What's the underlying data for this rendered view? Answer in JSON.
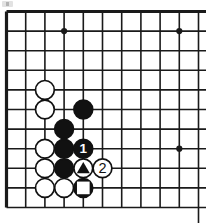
{
  "diagram": {
    "type": "go-board-corner-diagram",
    "board": {
      "cols": 11,
      "rows": 11,
      "x_start": 6.5,
      "y_start": 11.5,
      "spacing_x": 19.2,
      "spacing_y": 19.6,
      "line_color": "#1a1a1a",
      "line_width": 1.6,
      "edge_line_width": 3.2,
      "edge_left": true,
      "edge_top": true,
      "edge_right": false,
      "edge_bottom": false,
      "background": "#ffffff"
    },
    "star_points": [
      {
        "col": 3,
        "row": 1
      },
      {
        "col": 9,
        "row": 1
      },
      {
        "col": 9,
        "row": 7
      }
    ],
    "star_radius": 3.1,
    "stone_radius": 10.2,
    "colors": {
      "black": "#111111",
      "white": "#ffffff",
      "stone_outline": "#111111",
      "label_on_black": "#ffffff",
      "label_on_white": "#111111"
    },
    "stones": [
      {
        "col": 2,
        "row": 4,
        "color": "white",
        "mark": "none",
        "label": ""
      },
      {
        "col": 2,
        "row": 5,
        "color": "white",
        "mark": "none",
        "label": ""
      },
      {
        "col": 4,
        "row": 5,
        "color": "black",
        "mark": "none",
        "label": ""
      },
      {
        "col": 3,
        "row": 6,
        "color": "black",
        "mark": "none",
        "label": ""
      },
      {
        "col": 2,
        "row": 7,
        "color": "white",
        "mark": "none",
        "label": ""
      },
      {
        "col": 3,
        "row": 7,
        "color": "black",
        "mark": "none",
        "label": ""
      },
      {
        "col": 4,
        "row": 7,
        "color": "black",
        "mark": "number",
        "label": "1"
      },
      {
        "col": 2,
        "row": 8,
        "color": "white",
        "mark": "none",
        "label": ""
      },
      {
        "col": 3,
        "row": 8,
        "color": "black",
        "mark": "none",
        "label": ""
      },
      {
        "col": 4,
        "row": 8,
        "color": "white",
        "mark": "triangle",
        "label": ""
      },
      {
        "col": 5,
        "row": 8,
        "color": "white",
        "mark": "number",
        "label": "2"
      },
      {
        "col": 2,
        "row": 9,
        "color": "white",
        "mark": "none",
        "label": ""
      },
      {
        "col": 3,
        "row": 9,
        "color": "white",
        "mark": "none",
        "label": ""
      },
      {
        "col": 4,
        "row": 9,
        "color": "black",
        "mark": "square",
        "label": ""
      }
    ]
  }
}
